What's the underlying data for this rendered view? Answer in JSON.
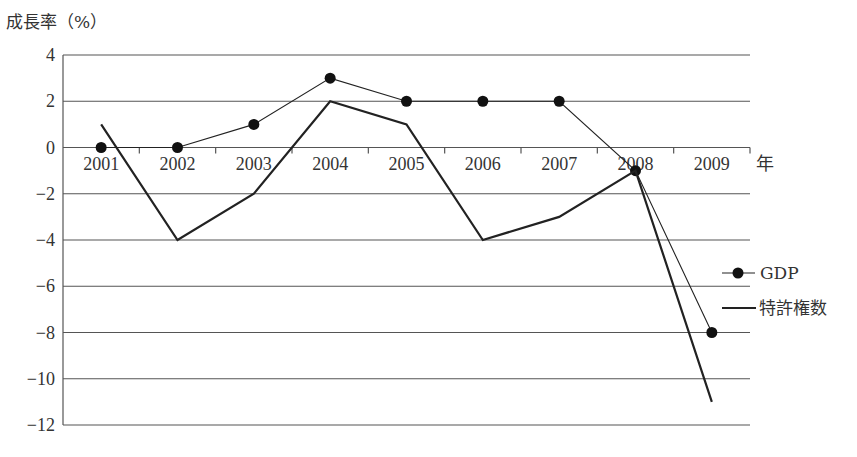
{
  "chart_data": {
    "type": "line",
    "title": "",
    "ylabel": "成長率（%）",
    "xlabel": "年",
    "categories": [
      "2001",
      "2002",
      "2003",
      "2004",
      "2005",
      "2006",
      "2007",
      "2008",
      "2009"
    ],
    "series": [
      {
        "name": "GDP",
        "marker": "circle",
        "line_width": "thin",
        "values": [
          0,
          0,
          1,
          3,
          2,
          2,
          2,
          -1,
          -8
        ]
      },
      {
        "name": "特許権数",
        "marker": "none",
        "line_width": "thick",
        "values": [
          1,
          -4,
          -2,
          2,
          1,
          -4,
          -3,
          -1,
          -11
        ]
      }
    ],
    "ylim": [
      -12,
      4
    ],
    "yticks": [
      4,
      2,
      0,
      -2,
      -4,
      -6,
      -8,
      -10,
      -12
    ],
    "ytick_labels": [
      "4",
      "2",
      "0",
      "−2",
      "−4",
      "−6",
      "−8",
      "−10",
      "−12"
    ],
    "grid": "horizontal",
    "legend_position": "right"
  },
  "labels": {
    "ylabel": "成長率（%）",
    "xunit": "年",
    "legend_gdp": "GDP",
    "legend_patent": "特許権数"
  },
  "colors": {
    "line": "#222222",
    "grid": "#555555",
    "text": "#333333"
  }
}
